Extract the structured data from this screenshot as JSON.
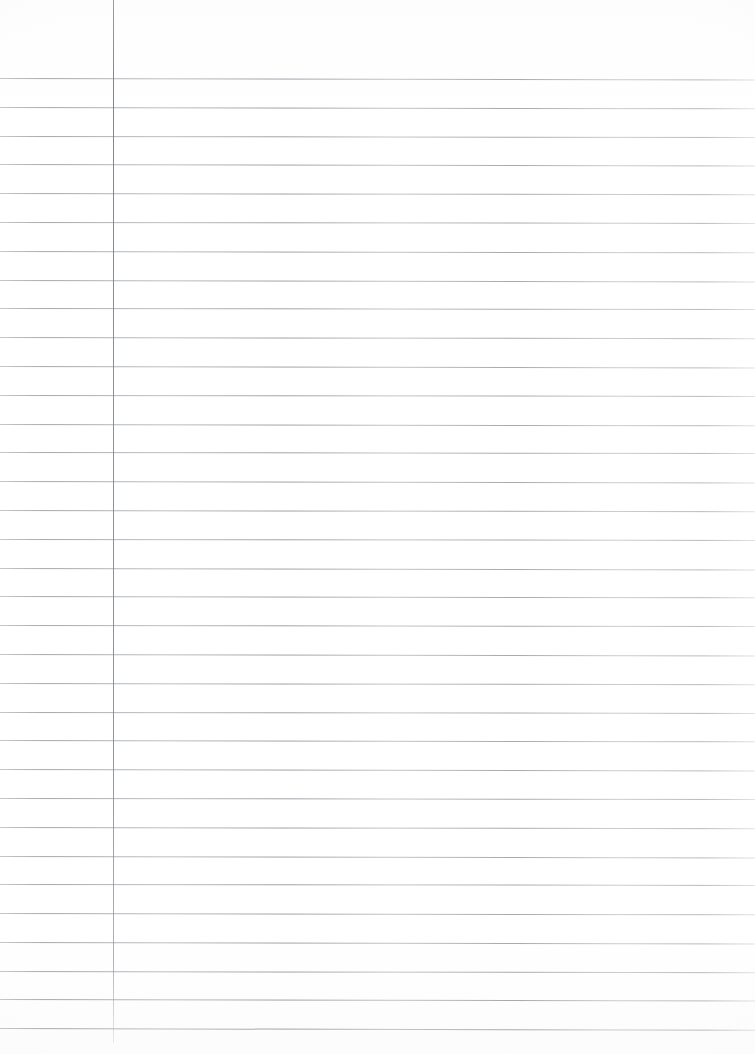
{
  "document": {
    "kind": "scanned-blank-lined-notebook-page",
    "title": "Blank Lined Notebook Page",
    "visible_text": "",
    "page_width_px": 755,
    "page_height_px": 1054,
    "background_color": "#ffffff"
  },
  "ruling": {
    "type": "single-ruled-with-left-margin",
    "line_color": "#8b9098",
    "line_thickness_px": 1,
    "line_spacing_px": 28.8,
    "first_line_y_px": 78,
    "line_count": 34,
    "line_start_x_px": 0,
    "line_end_x_px": 755,
    "line_y_positions": [
      78,
      107,
      136,
      164,
      193,
      222,
      251,
      280,
      308,
      337,
      366,
      395,
      424,
      452,
      481,
      510,
      539,
      568,
      596,
      625,
      654,
      683,
      712,
      740,
      769,
      798,
      827,
      856,
      884,
      913,
      942,
      971,
      999,
      1028
    ],
    "line_tilt_deg": [
      0.12,
      0.1,
      0.08,
      0.11,
      0.09,
      0.07,
      0.1,
      0.12,
      0.08,
      0.09,
      0.11,
      0.07,
      0.1,
      0.08,
      0.12,
      0.09,
      0.07,
      0.11,
      0.1,
      0.08,
      0.12,
      0.09,
      0.07,
      0.1,
      0.11,
      0.08,
      0.09,
      0.12,
      0.07,
      0.1,
      0.11,
      0.09,
      0.12,
      0.14
    ]
  },
  "margin": {
    "name": "left-margin-rule",
    "color": "#7c8189",
    "x_px": 113,
    "top_y_px": 0,
    "bottom_y_px": 1043,
    "thickness_px": 1,
    "orientation": "vertical"
  }
}
